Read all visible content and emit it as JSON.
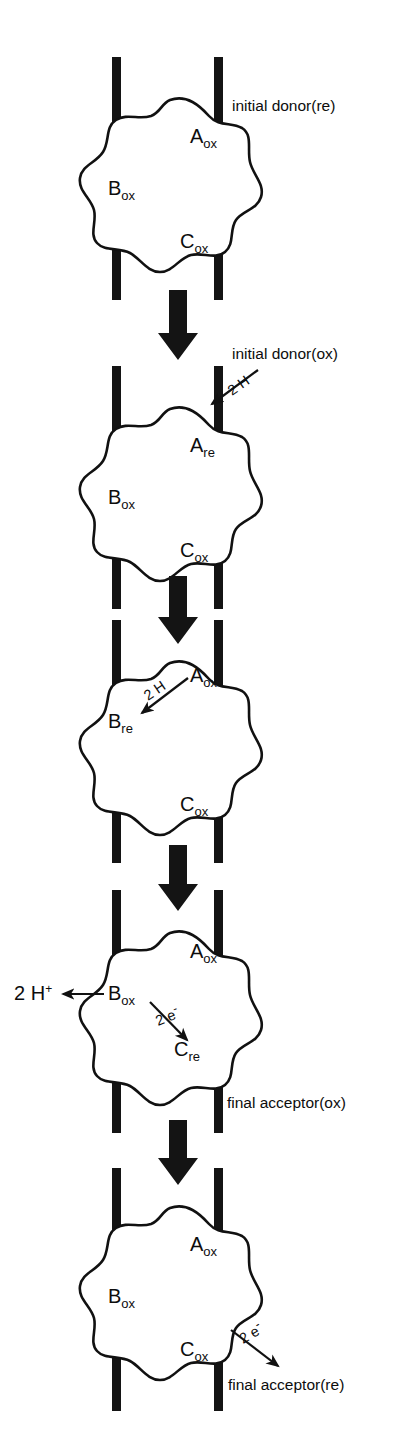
{
  "figure": {
    "type": "diagram",
    "background_color": "#ffffff",
    "ink_color": "#111111",
    "panel_count": 5,
    "carriers": [
      "A",
      "B",
      "C"
    ],
    "states": {
      "oxidized": "ox",
      "reduced": "re"
    }
  },
  "panels": [
    {
      "index": 1,
      "species": [
        {
          "id": "A",
          "base": "A",
          "sub": "ox"
        },
        {
          "id": "B",
          "base": "B",
          "sub": "ox"
        },
        {
          "id": "C",
          "base": "C",
          "sub": "ox"
        }
      ],
      "captions": [
        {
          "id": "initial-donor-re",
          "text": "initial donor(re)"
        }
      ],
      "flux_labels": [],
      "has_step_arrow": true
    },
    {
      "index": 2,
      "species": [
        {
          "id": "A",
          "base": "A",
          "sub": "re"
        },
        {
          "id": "B",
          "base": "B",
          "sub": "ox"
        },
        {
          "id": "C",
          "base": "C",
          "sub": "ox"
        }
      ],
      "captions": [
        {
          "id": "initial-donor-ox",
          "text": "initial donor(ox)"
        }
      ],
      "flux_labels": [
        {
          "id": "two-h-in",
          "text": "2 H"
        }
      ],
      "has_step_arrow": true
    },
    {
      "index": 3,
      "species": [
        {
          "id": "A",
          "base": "A",
          "sub": "ox"
        },
        {
          "id": "B",
          "base": "B",
          "sub": "re"
        },
        {
          "id": "C",
          "base": "C",
          "sub": "ox"
        }
      ],
      "captions": [],
      "flux_labels": [
        {
          "id": "two-h-internal",
          "text": "2 H"
        }
      ],
      "has_step_arrow": true
    },
    {
      "index": 4,
      "species": [
        {
          "id": "A",
          "base": "A",
          "sub": "ox"
        },
        {
          "id": "B",
          "base": "B",
          "sub": "ox"
        },
        {
          "id": "C",
          "base": "C",
          "sub": "re"
        }
      ],
      "captions": [
        {
          "id": "final-acceptor-ox",
          "text": "final acceptor(ox)"
        }
      ],
      "flux_labels": [
        {
          "id": "two-h-plus-out",
          "text": "2 H",
          "superscript": "+"
        },
        {
          "id": "two-e-minus-internal",
          "text": "2 e",
          "superscript": "-"
        }
      ],
      "has_step_arrow": true
    },
    {
      "index": 5,
      "species": [
        {
          "id": "A",
          "base": "A",
          "sub": "ox"
        },
        {
          "id": "B",
          "base": "B",
          "sub": "ox"
        },
        {
          "id": "C",
          "base": "C",
          "sub": "ox"
        }
      ],
      "captions": [
        {
          "id": "final-acceptor-re",
          "text": "final acceptor(re)"
        }
      ],
      "flux_labels": [
        {
          "id": "two-e-minus-out",
          "text": "2 e",
          "superscript": "-"
        }
      ],
      "has_step_arrow": false
    }
  ]
}
